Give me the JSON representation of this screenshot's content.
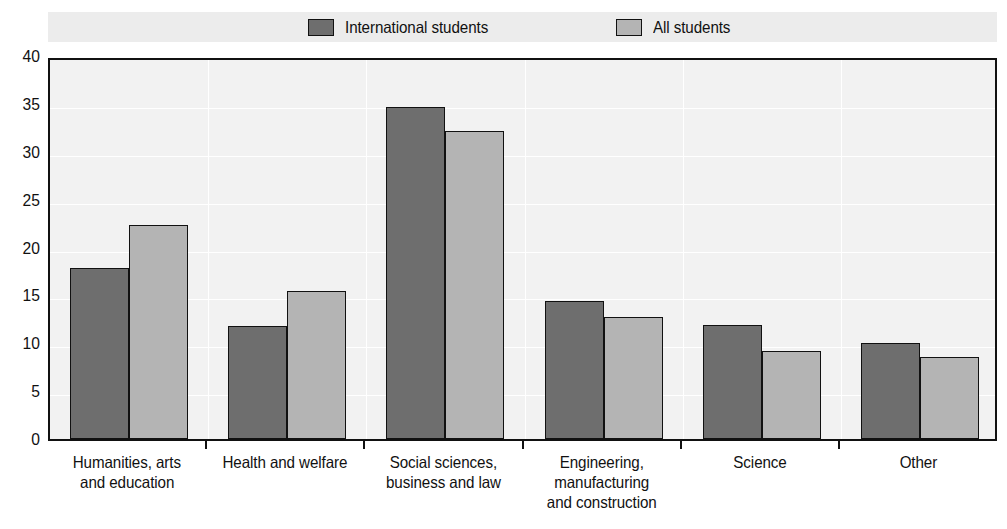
{
  "legend": {
    "entries": [
      {
        "label": "International students",
        "color": "#6e6e6e",
        "swatch": "legend-swatch-international"
      },
      {
        "label": "All students",
        "color": "#b4b4b4",
        "swatch": "legend-swatch-all"
      }
    ]
  },
  "axis": {
    "y_ticks": [
      "40",
      "35",
      "30",
      "25",
      "20",
      "15",
      "10",
      "5",
      "0"
    ]
  },
  "chart_data": {
    "type": "bar",
    "title": "",
    "subtitle": "",
    "xlabel": "",
    "ylabel": "",
    "ylim": [
      0,
      40
    ],
    "ytick_step": 5,
    "grid": true,
    "legend_position": "top",
    "categories": [
      "Humanities, arts\nand education",
      "Health and welfare",
      "Social sciences,\nbusiness and law",
      "Engineering,\nmanufacturing\nand construction",
      "Science",
      "Other"
    ],
    "series": [
      {
        "name": "International students",
        "color": "#6e6e6e",
        "values": [
          17.9,
          11.8,
          34.7,
          14.4,
          11.9,
          10.0
        ]
      },
      {
        "name": "All students",
        "color": "#b4b4b4",
        "values": [
          22.3,
          15.5,
          32.2,
          12.7,
          9.2,
          8.6
        ]
      }
    ]
  }
}
